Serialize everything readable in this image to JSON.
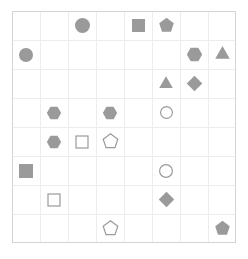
{
  "figure": {
    "kind": "shape-grid",
    "background_color": "#ffffff",
    "border_color": "#d4d4d4",
    "gridline_color": "#ececec",
    "shape_fill_color": "#9a9a9a",
    "shape_stroke_color": "#9a9a9a",
    "open_shape_fill_color": "#ffffff",
    "grid": {
      "columns": 8,
      "rows": 8,
      "cell_width": 28,
      "cell_height": 29,
      "origin_x": 12,
      "origin_y": 11
    },
    "shape_count": 21,
    "shapes": [
      {
        "row": 0,
        "col": 2,
        "shape": "circle",
        "style": "filled",
        "size": 15,
        "name": "filled-circle"
      },
      {
        "row": 0,
        "col": 4,
        "shape": "square",
        "style": "filled",
        "size": 13,
        "name": "filled-square"
      },
      {
        "row": 0,
        "col": 5,
        "shape": "pentagon",
        "style": "filled",
        "size": 15,
        "name": "filled-pentagon"
      },
      {
        "row": 1,
        "col": 0,
        "shape": "circle",
        "style": "filled",
        "size": 14,
        "name": "filled-circle"
      },
      {
        "row": 1,
        "col": 6,
        "shape": "hexagon",
        "style": "filled",
        "size": 15,
        "name": "filled-hexagon"
      },
      {
        "row": 1,
        "col": 7,
        "shape": "triangle",
        "style": "filled",
        "size": 15,
        "name": "filled-triangle"
      },
      {
        "row": 2,
        "col": 5,
        "shape": "triangle",
        "style": "filled",
        "size": 14,
        "name": "filled-triangle"
      },
      {
        "row": 2,
        "col": 6,
        "shape": "diamond",
        "style": "filled",
        "size": 15,
        "name": "filled-diamond"
      },
      {
        "row": 3,
        "col": 1,
        "shape": "hexagon",
        "style": "filled",
        "size": 14,
        "name": "filled-hexagon"
      },
      {
        "row": 3,
        "col": 3,
        "shape": "hexagon",
        "style": "filled",
        "size": 14,
        "name": "filled-hexagon"
      },
      {
        "row": 3,
        "col": 5,
        "shape": "circle",
        "style": "open",
        "size": 13,
        "name": "open-circle"
      },
      {
        "row": 4,
        "col": 1,
        "shape": "hexagon",
        "style": "filled",
        "size": 14,
        "name": "filled-hexagon"
      },
      {
        "row": 4,
        "col": 2,
        "shape": "square",
        "style": "open",
        "size": 12,
        "name": "open-square"
      },
      {
        "row": 4,
        "col": 3,
        "shape": "pentagon",
        "style": "open",
        "size": 15,
        "name": "open-pentagon"
      },
      {
        "row": 5,
        "col": 0,
        "shape": "square",
        "style": "filled",
        "size": 14,
        "name": "filled-square"
      },
      {
        "row": 5,
        "col": 5,
        "shape": "circle",
        "style": "open",
        "size": 14,
        "name": "open-circle"
      },
      {
        "row": 6,
        "col": 1,
        "shape": "square",
        "style": "open",
        "size": 12,
        "name": "open-square"
      },
      {
        "row": 6,
        "col": 5,
        "shape": "diamond",
        "style": "filled",
        "size": 15,
        "name": "filled-diamond"
      },
      {
        "row": 7,
        "col": 3,
        "shape": "pentagon",
        "style": "open",
        "size": 15,
        "name": "open-pentagon"
      },
      {
        "row": 7,
        "col": 7,
        "shape": "pentagon",
        "style": "filled",
        "size": 15,
        "name": "filled-pentagon"
      }
    ]
  }
}
